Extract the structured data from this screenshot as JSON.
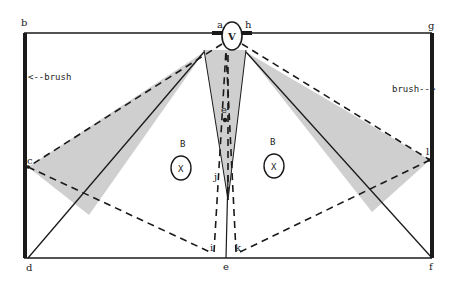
{
  "diagram": {
    "colors": {
      "line": "#1a1a1a",
      "shade": "#cfcfcf",
      "background": "#ffffff"
    },
    "points": {
      "a": "a",
      "b": "b",
      "c": "c",
      "d": "d",
      "e": "e",
      "e_prime": "e'",
      "f": "f",
      "g": "g",
      "h": "h",
      "i": "i",
      "j": "j",
      "k": "k",
      "l": "l"
    },
    "annotations": {
      "brush_left": "<--brush",
      "brush_right": "brush-->",
      "viewer": "V",
      "object_left_label": "B",
      "object_left": "X",
      "object_right_label": "B",
      "object_right": "X"
    }
  }
}
